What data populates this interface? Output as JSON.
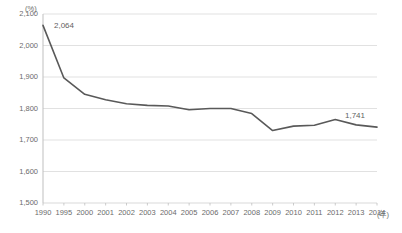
{
  "chart_data": {
    "type": "line",
    "title": "",
    "subtitle": "",
    "xlabel": "(年)",
    "ylabel": "(%)",
    "ylim": [
      1500,
      2100
    ],
    "ytick_values": [
      2100,
      2000,
      1900,
      1800,
      1700,
      1600,
      1500
    ],
    "ytick_labels": [
      "2,100",
      "2,000",
      "1,900",
      "1,800",
      "1,700",
      "1,600",
      "1,500"
    ],
    "grid": true,
    "grid_axis": "y",
    "legend": false,
    "legend_position": "none",
    "line_color": "#595959",
    "grid_color": "#d9d9d9",
    "axis_color": "#bfbfbf",
    "categories": [
      "1990",
      "1995",
      "2000",
      "2001",
      "2002",
      "2003",
      "2004",
      "2005",
      "2006",
      "2007",
      "2008",
      "2009",
      "2010",
      "2011",
      "2012",
      "2013",
      "2014"
    ],
    "x": [
      1990,
      1995,
      2000,
      2001,
      2002,
      2003,
      2004,
      2005,
      2006,
      2007,
      2008,
      2009,
      2010,
      2011,
      2012,
      2013,
      2014
    ],
    "values": [
      2064,
      1897,
      1845,
      1828,
      1815,
      1810,
      1808,
      1796,
      1800,
      1800,
      1784,
      1730,
      1744,
      1747,
      1765,
      1748,
      1741
    ],
    "annotations": [
      {
        "label": "2,064",
        "x": 1990,
        "y": 2064
      },
      {
        "label": "1,741",
        "x": 2014,
        "y": 1741
      }
    ]
  },
  "axes": {
    "y_unit": "(%)",
    "x_unit": "(年)"
  }
}
